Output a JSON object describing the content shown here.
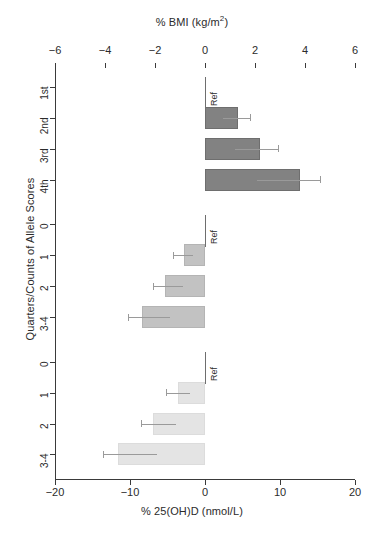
{
  "chart_data": {
    "type": "bar",
    "title": "",
    "orientation": "horizontal",
    "ylabel": "Quarters/Counts of Allele Scores",
    "top_axis": {
      "label": "% BMI (kg/m2)",
      "label_prefix": "% BMI (kg/m",
      "label_sup": "2",
      "label_suffix": ")",
      "ticks": [
        -6,
        -4,
        -2,
        0,
        2,
        4,
        6
      ],
      "tick_labels": [
        "−6",
        "−4",
        "−2",
        "0",
        "2",
        "4",
        "6"
      ],
      "xlim": [
        -6,
        6
      ]
    },
    "bottom_axis": {
      "label": "% 25(OH)D (nmol/L)",
      "ticks": [
        -20,
        -10,
        0,
        10,
        20
      ],
      "tick_labels": [
        "−20",
        "−10",
        "0",
        "10",
        "20"
      ],
      "xlim": [
        -20,
        20
      ]
    },
    "grid": false,
    "legend": "none",
    "reference_label": "Ref",
    "panels": [
      {
        "name": "BMI allele score",
        "caption_lines": [
          "BMI",
          "allele score"
        ],
        "axis": "top",
        "color": "#828282",
        "categories": [
          "1st",
          "2nd",
          "3rd",
          "4th"
        ],
        "values": [
          0,
          1.3,
          2.2,
          3.8
        ],
        "ci_low": [
          0,
          0.8,
          1.5,
          3.0
        ],
        "ci_high": [
          0,
          1.8,
          2.9,
          4.6
        ],
        "reference_category": "1st"
      },
      {
        "name": "Vitamin D synthesis score",
        "caption_lines": [
          "Vitamin D",
          "synthesis score"
        ],
        "axis": "bottom",
        "color": "#c2c2c2",
        "categories": [
          "0",
          "1",
          "2",
          "3-4"
        ],
        "values": [
          0,
          -2.8,
          -5.3,
          -8.4
        ],
        "ci_low": [
          0,
          -4.3,
          -7.0,
          -10.3
        ],
        "ci_high": [
          0,
          -2.8,
          -5.3,
          -8.4
        ],
        "reference_category": "0"
      },
      {
        "name": "Vitamin D metabolism score",
        "caption_lines": [
          "Vitamin D",
          "metabolism score"
        ],
        "axis": "bottom",
        "color": "#e4e4e4",
        "categories": [
          "0",
          "1",
          "2",
          "3-4"
        ],
        "values": [
          0,
          -3.6,
          -7.0,
          -11.6
        ],
        "ci_low": [
          0,
          -5.2,
          -8.6,
          -13.6
        ],
        "ci_high": [
          0,
          -3.6,
          -7.0,
          -11.6
        ],
        "reference_category": "0"
      }
    ]
  }
}
